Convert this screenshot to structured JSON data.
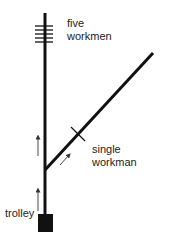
{
  "diagram": {
    "type": "trolley-problem",
    "colors": {
      "track": "#111111",
      "arrow": "#333333",
      "trolley": "#111111",
      "text": "#222222",
      "background": "#ffffff"
    },
    "labels": {
      "five_workmen": {
        "line1": "five",
        "line2": "workmen"
      },
      "single_workman": {
        "line1": "single",
        "line2": "workman"
      },
      "trolley": "trolley"
    },
    "elements": {
      "main_track": {
        "x": 45,
        "y_top": 13,
        "y_bottom": 214
      },
      "side_track": {
        "x1": 45,
        "y1": 170,
        "x2": 153,
        "y2": 53
      },
      "five_workmen_marks": {
        "count": 5,
        "x1": 35,
        "x2": 53,
        "y_start": 26,
        "spacing": 4
      },
      "single_workman_mark": {
        "cx": 78,
        "cy": 134
      },
      "trolley_box": {
        "x": 38,
        "y": 214,
        "width": 15,
        "height": 18
      },
      "arrows": [
        {
          "name": "upper-arrow",
          "x1": 38,
          "y1": 156,
          "x2": 38,
          "y2": 135
        },
        {
          "name": "lower-arrow",
          "x1": 38,
          "y1": 211,
          "x2": 38,
          "y2": 188
        },
        {
          "name": "diagonal-arrow",
          "x1": 60,
          "y1": 165,
          "x2": 70,
          "y2": 154
        }
      ]
    }
  }
}
